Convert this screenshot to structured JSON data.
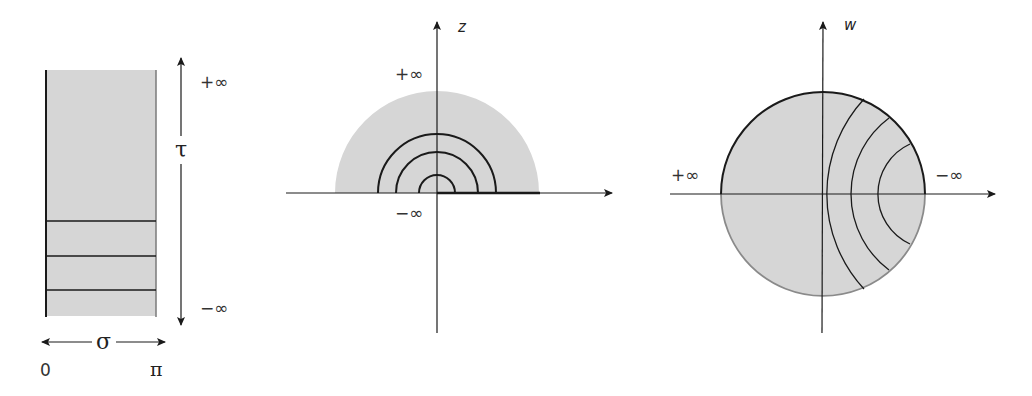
{
  "figure": {
    "colors": {
      "fill": "#d6d6d6",
      "line": "#1a1a1a",
      "light_edge": "#8a8a8a"
    },
    "panel_strip": {
      "plus_inf_label": "+∞",
      "minus_inf_label": "−∞",
      "tau_label": "τ",
      "sigma_label": "σ",
      "sigma_start_label": "0",
      "sigma_end_label": "π",
      "horizontal_lines": 3
    },
    "panel_z": {
      "axis_label": "z",
      "plus_inf_label": "+∞",
      "minus_inf_label": "−∞",
      "semicircle_arcs": 3
    },
    "panel_w": {
      "axis_label": "w",
      "plus_inf_label": "+∞",
      "minus_inf_label": "−∞",
      "inner_arcs": 3
    }
  }
}
